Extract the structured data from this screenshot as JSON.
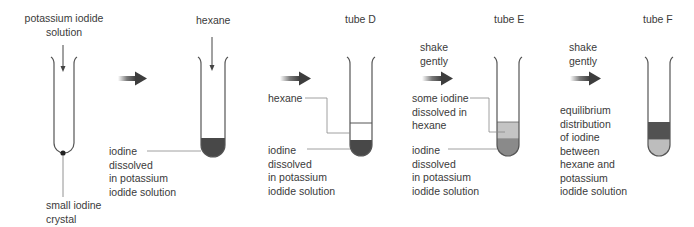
{
  "diagram": {
    "step1": {
      "top_label": "potassium iodide\nsolution",
      "bottom_label": "small iodine\ncrystal"
    },
    "step2": {
      "top_label": "hexane",
      "side_label": "iodine\ndissolved\nin potassium\niodide solution"
    },
    "step3": {
      "title": "tube D",
      "upper_label": "hexane",
      "lower_label": "iodine\ndissolved\nin potassium\niodide solution"
    },
    "step4": {
      "title": "tube E",
      "arrow_label": "shake\ngently",
      "upper_label": "some iodine\ndissolved in\nhexane",
      "lower_label": "iodine\ndissolved\nin potassium\niodide solution"
    },
    "step5": {
      "title": "tube F",
      "arrow_label": "shake\ngently",
      "description": "equilibrium\ndistribution\nof iodine\nbetween\nhexane and\npotassium\niodide solution"
    },
    "colors": {
      "iodine_dark": "#4a4a4a",
      "iodine_light": "#b8b8b8",
      "glass": "#555555",
      "arrow": "#3d3d3d"
    }
  }
}
